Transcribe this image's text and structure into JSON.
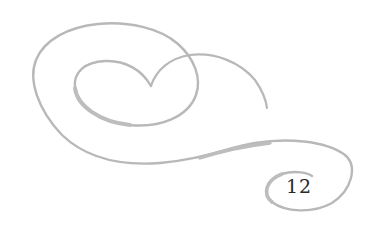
{
  "page": {
    "number": "12"
  },
  "ornament": {
    "icon": "swirl-flourish-icon",
    "stroke_color": "#b5b5b5"
  }
}
